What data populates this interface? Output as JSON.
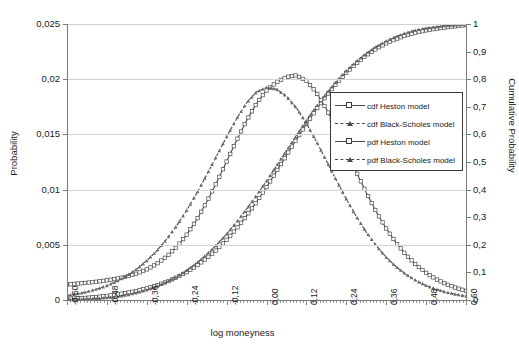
{
  "chart_data": {
    "type": "line",
    "title": "",
    "xlabel": "log moneyness",
    "ylabel": "Probability",
    "y2label": "Cumulative Probability",
    "xlim": [
      -0.6,
      0.6
    ],
    "ylim": [
      0,
      0.025
    ],
    "y2lim": [
      0,
      1
    ],
    "grid": true,
    "legend_position": "right-center",
    "xticks": [
      "-0,60",
      "-0,48",
      "-0,36",
      "-0,24",
      "-0,12",
      "0,00",
      "0,12",
      "0,24",
      "0,36",
      "0,48",
      "0,60"
    ],
    "xtick_values": [
      -0.6,
      -0.48,
      -0.36,
      -0.24,
      -0.12,
      0.0,
      0.12,
      0.24,
      0.36,
      0.48,
      0.6
    ],
    "yticks_left": [
      "0",
      "0,005",
      "0,01",
      "0,015",
      "0,02",
      "0,025"
    ],
    "ytick_values_left": [
      0,
      0.005,
      0.01,
      0.015,
      0.02,
      0.025
    ],
    "yticks_right": [
      "0",
      "0,1",
      "0,2",
      "0,3",
      "0,4",
      "0,5",
      "0,6",
      "0,7",
      "0,8",
      "0,9",
      "1"
    ],
    "ytick_values_right": [
      0,
      0.1,
      0.2,
      0.3,
      0.4,
      0.5,
      0.6,
      0.7,
      0.8,
      0.9,
      1.0
    ],
    "x": [
      -0.6,
      -0.57,
      -0.54,
      -0.51,
      -0.48,
      -0.45,
      -0.42,
      -0.39,
      -0.36,
      -0.33,
      -0.3,
      -0.27,
      -0.24,
      -0.21,
      -0.18,
      -0.15,
      -0.12,
      -0.09,
      -0.06,
      -0.03,
      0.0,
      0.03,
      0.06,
      0.09,
      0.12,
      0.15,
      0.18,
      0.21,
      0.24,
      0.27,
      0.3,
      0.33,
      0.36,
      0.39,
      0.42,
      0.45,
      0.48,
      0.51,
      0.54,
      0.57,
      0.6
    ],
    "series": [
      {
        "name": "cdf Heston model",
        "axis": "right",
        "marker": "square",
        "linestyle": "solid",
        "color": "#4a4a4a",
        "values": [
          0.004,
          0.006,
          0.008,
          0.011,
          0.015,
          0.02,
          0.026,
          0.033,
          0.042,
          0.053,
          0.066,
          0.082,
          0.101,
          0.124,
          0.151,
          0.182,
          0.218,
          0.259,
          0.305,
          0.355,
          0.409,
          0.466,
          0.524,
          0.582,
          0.638,
          0.691,
          0.74,
          0.784,
          0.823,
          0.857,
          0.886,
          0.91,
          0.93,
          0.946,
          0.959,
          0.969,
          0.977,
          0.983,
          0.988,
          0.992,
          0.996
        ]
      },
      {
        "name": "cdf Black-Scholes model",
        "axis": "right",
        "marker": "triangle",
        "linestyle": "dashed",
        "color": "#4a4a4a",
        "values": [
          0.001,
          0.002,
          0.003,
          0.005,
          0.008,
          0.012,
          0.018,
          0.026,
          0.036,
          0.049,
          0.065,
          0.084,
          0.107,
          0.134,
          0.165,
          0.2,
          0.239,
          0.282,
          0.329,
          0.379,
          0.431,
          0.486,
          0.541,
          0.596,
          0.65,
          0.701,
          0.748,
          0.791,
          0.83,
          0.864,
          0.893,
          0.918,
          0.938,
          0.955,
          0.968,
          0.978,
          0.985,
          0.99,
          0.994,
          0.997,
          0.999
        ]
      },
      {
        "name": "pdf Heston model",
        "axis": "left",
        "marker": "square",
        "linestyle": "solid",
        "color": "#4a4a4a",
        "values": [
          0.0014,
          0.00148,
          0.00156,
          0.00166,
          0.00178,
          0.00193,
          0.00213,
          0.0024,
          0.00277,
          0.00327,
          0.00394,
          0.00481,
          0.00592,
          0.00727,
          0.00886,
          0.01064,
          0.01254,
          0.01445,
          0.01625,
          0.0178,
          0.01898,
          0.01973,
          0.0202,
          0.02035,
          0.01985,
          0.0188,
          0.0173,
          0.0155,
          0.01355,
          0.0116,
          0.00973,
          0.008,
          0.00648,
          0.00517,
          0.00408,
          0.00318,
          0.00246,
          0.00189,
          0.00144,
          0.0011,
          0.00083
        ]
      },
      {
        "name": "pdf Black-Scholes model",
        "axis": "left",
        "marker": "triangle",
        "linestyle": "dashed",
        "color": "#4a4a4a",
        "values": [
          0.0004,
          0.00055,
          0.00074,
          0.00099,
          0.0013,
          0.0017,
          0.0022,
          0.00281,
          0.00356,
          0.00445,
          0.00551,
          0.00673,
          0.00812,
          0.00966,
          0.01132,
          0.01305,
          0.01478,
          0.01642,
          0.01785,
          0.01885,
          0.01925,
          0.0191,
          0.01845,
          0.0174,
          0.016,
          0.01437,
          0.01262,
          0.01085,
          0.00915,
          0.00757,
          0.00615,
          0.00492,
          0.00387,
          0.00301,
          0.00231,
          0.00175,
          0.00131,
          0.00097,
          0.00071,
          0.00051,
          0.00036
        ]
      }
    ]
  },
  "legend": {
    "entries": [
      {
        "label": "cdf Heston model"
      },
      {
        "label": "cdf Black-Scholes model"
      },
      {
        "label": "pdf Heston model"
      },
      {
        "label": "pdf Black-Scholes model"
      }
    ]
  },
  "caption": ""
}
